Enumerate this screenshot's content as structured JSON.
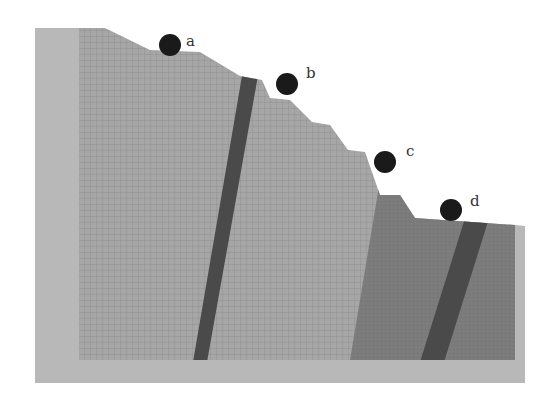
{
  "diagram": {
    "type": "slope-cross-section",
    "colors": {
      "background": "#ffffff",
      "frame": "#b8b8b8",
      "upper_rock": "#a6a6a6",
      "upper_rock_grid": "#8e8e8e",
      "lower_rock": "#7a7a7a",
      "dike": "#4a4a4a",
      "ball": "#1a1a1a"
    },
    "points": [
      {
        "id": "a",
        "label": "a",
        "cx": 170,
        "cy": 45,
        "r": 11
      },
      {
        "id": "b",
        "label": "b",
        "cx": 287,
        "cy": 84,
        "r": 11
      },
      {
        "id": "c",
        "label": "c",
        "cx": 385,
        "cy": 162,
        "r": 11
      },
      {
        "id": "d",
        "label": "d",
        "cx": 451,
        "cy": 210,
        "r": 11
      }
    ]
  }
}
